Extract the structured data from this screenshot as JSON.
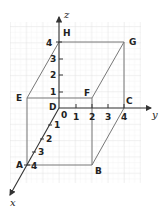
{
  "diagram": {
    "axes": {
      "x": {
        "label": "x",
        "ticks": [
          "1",
          "2",
          "3",
          "4"
        ]
      },
      "y": {
        "label": "y",
        "ticks": [
          "1",
          "2",
          "3",
          "4"
        ]
      },
      "z": {
        "label": "z",
        "ticks": [
          "1",
          "2",
          "3",
          "4"
        ]
      },
      "origin_label": "0"
    },
    "vertices": {
      "A": "A",
      "B": "B",
      "C": "C",
      "D": "D",
      "E": "E",
      "F": "F",
      "G": "G",
      "H": "H"
    },
    "colors": {
      "grid": "#e4e4e4",
      "edges": "#777777",
      "axes": "#333333"
    }
  }
}
